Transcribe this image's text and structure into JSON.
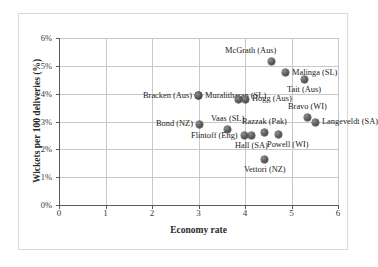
{
  "chart_data": {
    "type": "scatter",
    "title": "",
    "xlabel": "Economy rate",
    "ylabel": "Wickets per 100 deliveries (%)",
    "xlim": [
      0,
      6
    ],
    "ylim": [
      0,
      6
    ],
    "xticks": [
      "0",
      "1",
      "2",
      "3",
      "4",
      "5",
      "6"
    ],
    "yticks": [
      "0%",
      "1%",
      "2%",
      "3%",
      "4%",
      "5%",
      "6%"
    ],
    "grid": true,
    "legend": "none",
    "point_label_field": "label",
    "points": [
      {
        "label": "McGrath (Aus)",
        "x": 4.58,
        "y": 5.14,
        "label_pos": "above-left"
      },
      {
        "label": "Malinga (SL)",
        "x": 4.88,
        "y": 4.75,
        "label_pos": "right"
      },
      {
        "label": "Tait (Aus)",
        "x": 5.27,
        "y": 4.5,
        "label_pos": "below"
      },
      {
        "label": "Muralitharan (SL)",
        "x": 3.0,
        "y": 3.92,
        "label_pos": "right"
      },
      {
        "label": "Bracken (Aus)",
        "x": 3.0,
        "y": 3.92,
        "label_pos": "left"
      },
      {
        "label": "Hogg (Aus)",
        "x": 4.01,
        "y": 3.8,
        "label_pos": "right"
      },
      {
        "label": "Hogg-pair",
        "x": 3.87,
        "y": 3.8,
        "label_pos": "none"
      },
      {
        "label": "Bravo (WI)",
        "x": 5.34,
        "y": 3.13,
        "label_pos": "above"
      },
      {
        "label": "Langeveldt (SA)",
        "x": 5.51,
        "y": 2.98,
        "label_pos": "right"
      },
      {
        "label": "Bond (NZ)",
        "x": 3.02,
        "y": 2.91,
        "label_pos": "left"
      },
      {
        "label": "Vaas (SL)",
        "x": 3.63,
        "y": 2.7,
        "label_pos": "above"
      },
      {
        "label": "Razzak (Pak)",
        "x": 4.41,
        "y": 2.59,
        "label_pos": "above"
      },
      {
        "label": "Powell (WI)",
        "x": 4.71,
        "y": 2.55,
        "label_pos": "below-right"
      },
      {
        "label": "Hall (SA)",
        "x": 4.15,
        "y": 2.48,
        "label_pos": "below"
      },
      {
        "label": "Flintoff (Eng)",
        "x": 3.98,
        "y": 2.48,
        "label_pos": "left"
      },
      {
        "label": "Vettori (NZ)",
        "x": 4.43,
        "y": 1.65,
        "label_pos": "below"
      }
    ]
  },
  "colors": {
    "marker": "#4a4a4a",
    "axis": "#5a5a5a",
    "grid": "#c8c8c8",
    "frame": "#d9d9d9",
    "text": "#222222",
    "background": "#ffffff"
  }
}
